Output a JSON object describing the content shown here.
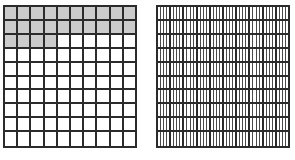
{
  "figure": {
    "title": "",
    "background_color": "#ffffff",
    "grid_line_color": "#2b2b2b",
    "sub_line_color": "#4a4a4a",
    "shade_color": "#cccccc",
    "cell_fill_color": "#ffffff"
  },
  "chart_data": {
    "type": "heatmap",
    "title": "",
    "xlabel": "",
    "ylabel": "",
    "grid": true,
    "legend": "none",
    "panels": [
      {
        "name": "left-hundredths-grid",
        "rows": 10,
        "columns": 10,
        "total_cells": 100,
        "shaded_cells": 24,
        "value": 0.24,
        "shading_pattern": "rows 1-2 fully shaded, row 3 shaded in first 4 columns",
        "cells": [
          [
            1,
            1,
            1,
            1,
            1,
            1,
            1,
            1,
            1,
            1
          ],
          [
            1,
            1,
            1,
            1,
            1,
            1,
            1,
            1,
            1,
            1
          ],
          [
            1,
            1,
            1,
            1,
            0,
            0,
            0,
            0,
            0,
            0
          ],
          [
            0,
            0,
            0,
            0,
            0,
            0,
            0,
            0,
            0,
            0
          ],
          [
            0,
            0,
            0,
            0,
            0,
            0,
            0,
            0,
            0,
            0
          ],
          [
            0,
            0,
            0,
            0,
            0,
            0,
            0,
            0,
            0,
            0
          ],
          [
            0,
            0,
            0,
            0,
            0,
            0,
            0,
            0,
            0,
            0
          ],
          [
            0,
            0,
            0,
            0,
            0,
            0,
            0,
            0,
            0,
            0
          ],
          [
            0,
            0,
            0,
            0,
            0,
            0,
            0,
            0,
            0,
            0
          ],
          [
            0,
            0,
            0,
            0,
            0,
            0,
            0,
            0,
            0,
            0
          ]
        ]
      },
      {
        "name": "right-subdivided-grid",
        "rows": 10,
        "columns": 10,
        "total_cells": 100,
        "subdivisions_per_cell": 4,
        "total_subdivisions": 4000,
        "shaded_cells": 0,
        "value": 0,
        "shading_pattern": "no major shading; every major cell subdivided into vertical strips"
      }
    ]
  }
}
